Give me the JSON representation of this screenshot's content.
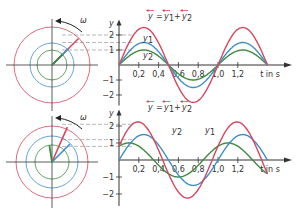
{
  "colors": {
    "sum": "#d6475f",
    "y1": "#3d8fc6",
    "y2": "#3f8a3f",
    "axis": "#333333",
    "dash": "#888888"
  },
  "panels": [
    {
      "name": "in-phase",
      "omega_label": "ω",
      "formula": {
        "y": "y",
        "eq": "=",
        "y1": "y",
        "plus": "+",
        "y2": "y",
        "sub1": "1",
        "sub2": "2"
      },
      "y_axis_label": "y",
      "y_ticks": [
        "2",
        "1",
        "−1",
        "−2"
      ],
      "x_ticks": [
        "0,2",
        "0,4",
        "0,6",
        "0,8",
        "1,0",
        "1,2"
      ],
      "x_axis_label": "t in s",
      "curve_labels": {
        "y1": "y",
        "y1_sub": "1",
        "y2": "y",
        "y2_sub": "2"
      }
    },
    {
      "name": "phase-shifted",
      "omega_label": "ω",
      "formula": {
        "y": "y",
        "eq": "=",
        "y1": "y",
        "plus": "+",
        "y2": "y",
        "sub1": "1",
        "sub2": "2"
      },
      "y_axis_label": "y",
      "y_ticks": [
        "2",
        "1",
        "−1",
        "−2"
      ],
      "x_ticks": [
        "0,2",
        "0,4",
        "0,6",
        "0,8",
        "1,0",
        "1,2"
      ],
      "x_axis_label": "t in s",
      "curve_labels": {
        "y1": "y",
        "y1_sub": "1",
        "y2": "y",
        "y2_sub": "2"
      }
    }
  ],
  "chart_data": [
    {
      "type": "line",
      "title": "y = y1 + y2 (in phase)",
      "xlabel": "t in s",
      "ylabel": "y",
      "xlim": [
        0,
        1.5
      ],
      "ylim": [
        -2.5,
        2.5
      ],
      "series": [
        {
          "name": "y1",
          "amplitude": 1.5,
          "phase_shift_s": 0
        },
        {
          "name": "y2",
          "amplitude": 1.0,
          "phase_shift_s": 0
        },
        {
          "name": "y",
          "amplitude": 2.5,
          "phase_shift_s": 0
        }
      ],
      "period_s": 1.0
    },
    {
      "type": "line",
      "title": "y = y1 + y2 (phase shifted)",
      "xlabel": "t in s",
      "ylabel": "y",
      "xlim": [
        0,
        1.5
      ],
      "ylim": [
        -2.5,
        2.5
      ],
      "series": [
        {
          "name": "y1",
          "amplitude": 1.5,
          "phase_shift_s": 0
        },
        {
          "name": "y2",
          "amplitude": 1.0,
          "phase_shift_s": -0.15
        },
        {
          "name": "y",
          "amplitude": 2.1,
          "phase_shift_s": -0.07
        }
      ],
      "period_s": 1.0
    }
  ]
}
